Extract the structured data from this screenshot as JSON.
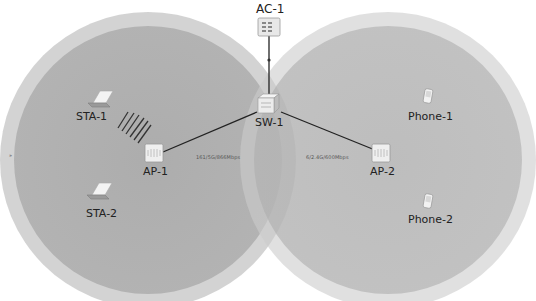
{
  "colors": {
    "background": "#ffffff",
    "coverage_outer": "#c9c9c9",
    "coverage_inner": "#a9a9a9",
    "link": "#222222",
    "label_text": "#222222"
  },
  "coverage_areas": [
    {
      "id": "ap1-coverage",
      "cx": 148,
      "cy": 160,
      "r_outer": 148,
      "r_inner": 134
    },
    {
      "id": "ap2-coverage",
      "cx": 388,
      "cy": 160,
      "r_outer": 148,
      "r_inner": 134
    }
  ],
  "nodes": {
    "ac1": {
      "label": "AC-1",
      "type": "access-controller"
    },
    "sw1": {
      "label": "SW-1",
      "type": "switch"
    },
    "ap1": {
      "label": "AP-1",
      "type": "access-point"
    },
    "ap2": {
      "label": "AP-2",
      "type": "access-point"
    },
    "sta1": {
      "label": "STA-1",
      "type": "laptop"
    },
    "sta2": {
      "label": "STA-2",
      "type": "laptop"
    },
    "phone1": {
      "label": "Phone-1",
      "type": "phone"
    },
    "phone2": {
      "label": "Phone-2",
      "type": "phone"
    }
  },
  "links": [
    {
      "from": "AC-1",
      "to": "SW-1",
      "label": ""
    },
    {
      "from": "SW-1",
      "to": "AP-1",
      "label": "161/5G/866Mbps"
    },
    {
      "from": "SW-1",
      "to": "AP-2",
      "label": "6/2.4G/600Mbps"
    }
  ],
  "wireless": [
    {
      "from": "AP-1",
      "to": "STA-1",
      "type": "signal-waves"
    }
  ],
  "edge_marker": "»"
}
